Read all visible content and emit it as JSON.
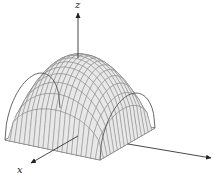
{
  "figure": {
    "axes": {
      "x_label": "x",
      "y_label": "",
      "z_label": "z"
    },
    "colors": {
      "surface_fill": "#e8e8e8",
      "mesh_line": "#7a7a7a",
      "edge_line": "#555555",
      "axis_line": "#333333",
      "background": "#ffffff"
    },
    "mesh": {
      "u_divisions": 16,
      "v_divisions": 20
    }
  }
}
